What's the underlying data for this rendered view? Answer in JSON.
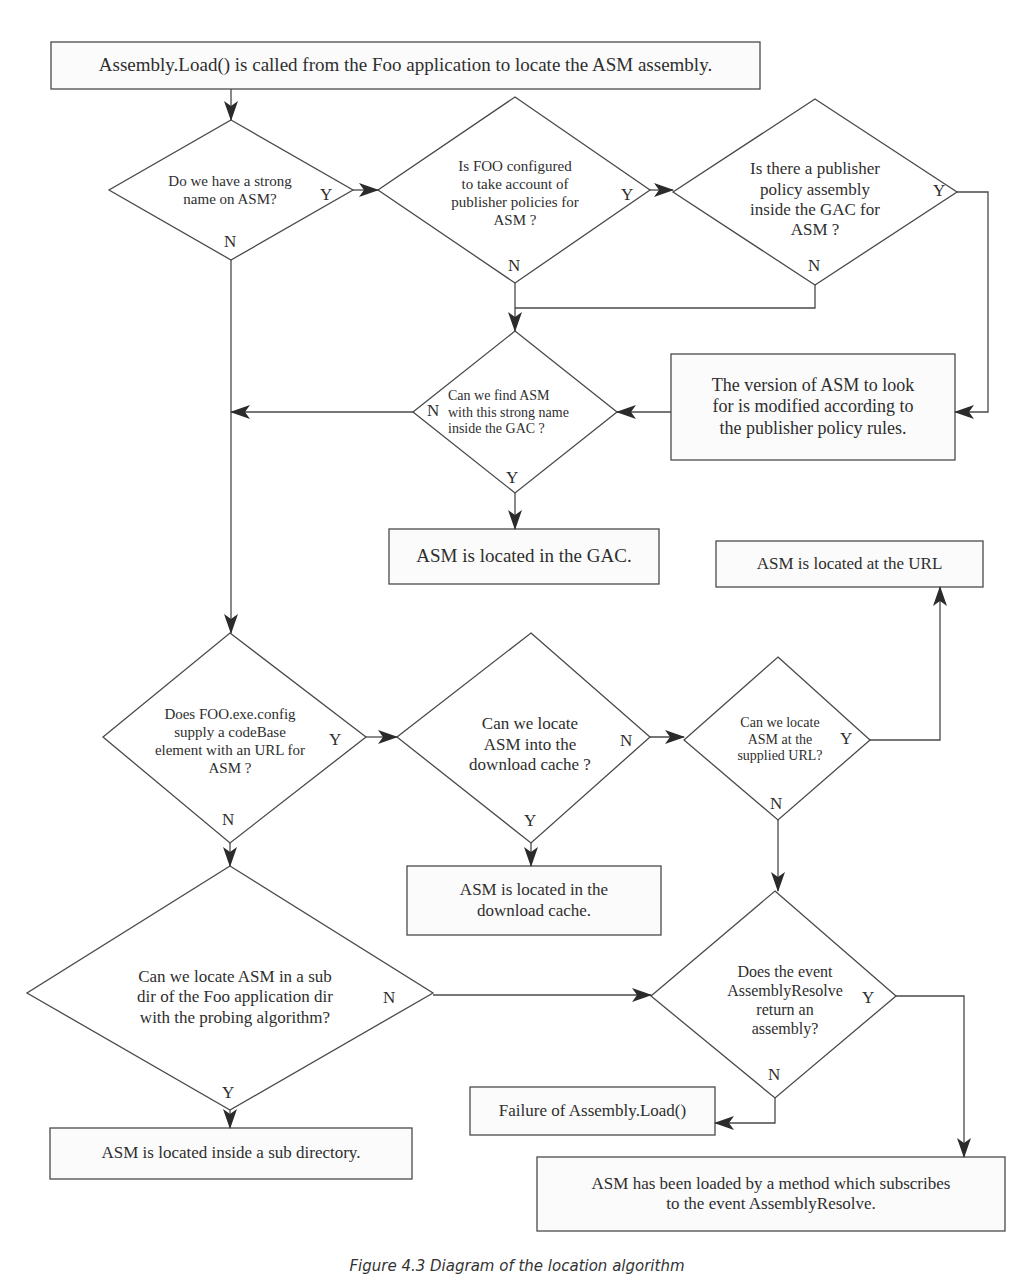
{
  "diagram": {
    "type": "flowchart",
    "caption": "Figure 4.3 Diagram of the location algorithm",
    "nodes": {
      "start": {
        "kind": "process",
        "text": "Assembly.Load() is called from the Foo application to locate the ASM assembly."
      },
      "strong_name": {
        "kind": "decision",
        "text": "Do we have a strong\nname on ASM?",
        "yes": "Y",
        "no": "N"
      },
      "foo_configured": {
        "kind": "decision",
        "text": "Is FOO configured\nto take account of\npublisher policies for\nASM ?",
        "yes": "Y",
        "no": "N"
      },
      "publisher_policy": {
        "kind": "decision",
        "text": "Is there a publisher\npolicy assembly\ninside the GAC for\nASM ?",
        "yes": "Y",
        "no": "N"
      },
      "find_in_gac": {
        "kind": "decision",
        "text": "Can we find ASM\nwith this strong name\ninside the GAC ?",
        "yes": "Y",
        "no": "N"
      },
      "version_modified": {
        "kind": "process",
        "text": "The version of ASM to look\nfor is modified according to\nthe publisher policy rules."
      },
      "located_gac": {
        "kind": "terminal",
        "text": "ASM is located in the GAC."
      },
      "located_url": {
        "kind": "terminal",
        "text": "ASM is located at the URL"
      },
      "codebase": {
        "kind": "decision",
        "text": "Does FOO.exe.config\nsupply a codeBase\nelement with an URL for\nASM ?",
        "yes": "Y",
        "no": "N"
      },
      "download_cache": {
        "kind": "decision",
        "text": "Can we locate\nASM into the\ndownload cache ?",
        "yes": "Y",
        "no": "N"
      },
      "at_url": {
        "kind": "decision",
        "text": "Can we locate\nASM at the\nsupplied URL?",
        "yes": "Y",
        "no": "N"
      },
      "located_cache": {
        "kind": "terminal",
        "text": "ASM is located in the\ndownload cache."
      },
      "probing": {
        "kind": "decision",
        "text": "Can we locate ASM in a sub\ndir of the Foo application dir\nwith the probing algorithm?",
        "yes": "Y",
        "no": "N"
      },
      "assembly_resolve": {
        "kind": "decision",
        "text": "Does the event\nAssemblyResolve\nreturn an\nassembly?",
        "yes": "Y",
        "no": "N"
      },
      "failure": {
        "kind": "terminal",
        "text": "Failure of Assembly.Load()"
      },
      "located_subdir": {
        "kind": "terminal",
        "text": "ASM is located inside a sub directory."
      },
      "loaded_by_event": {
        "kind": "terminal",
        "text": "ASM has been loaded by a method which subscribes\nto the event AssemblyResolve."
      }
    },
    "edges": [
      {
        "from": "start",
        "to": "strong_name",
        "label": ""
      },
      {
        "from": "strong_name",
        "to": "foo_configured",
        "label": "Y"
      },
      {
        "from": "strong_name",
        "to": "codebase",
        "label": "N"
      },
      {
        "from": "foo_configured",
        "to": "publisher_policy",
        "label": "Y"
      },
      {
        "from": "foo_configured",
        "to": "find_in_gac",
        "label": "N"
      },
      {
        "from": "publisher_policy",
        "to": "version_modified",
        "label": "Y"
      },
      {
        "from": "publisher_policy",
        "to": "find_in_gac",
        "label": "N"
      },
      {
        "from": "version_modified",
        "to": "find_in_gac",
        "label": ""
      },
      {
        "from": "find_in_gac",
        "to": "located_gac",
        "label": "Y"
      },
      {
        "from": "find_in_gac",
        "to": "codebase",
        "label": "N"
      },
      {
        "from": "codebase",
        "to": "download_cache",
        "label": "Y"
      },
      {
        "from": "codebase",
        "to": "probing",
        "label": "N"
      },
      {
        "from": "download_cache",
        "to": "located_cache",
        "label": "Y"
      },
      {
        "from": "download_cache",
        "to": "at_url",
        "label": "N"
      },
      {
        "from": "at_url",
        "to": "located_url",
        "label": "Y"
      },
      {
        "from": "at_url",
        "to": "assembly_resolve",
        "label": "N"
      },
      {
        "from": "probing",
        "to": "located_subdir",
        "label": "Y"
      },
      {
        "from": "probing",
        "to": "assembly_resolve",
        "label": "N"
      },
      {
        "from": "assembly_resolve",
        "to": "loaded_by_event",
        "label": "Y"
      },
      {
        "from": "assembly_resolve",
        "to": "failure",
        "label": "N"
      }
    ]
  },
  "colors": {
    "stroke": "#4a4a4a",
    "arrow": "#2b2b2b",
    "text": "#2e2e2e",
    "background": "#ffffff"
  }
}
